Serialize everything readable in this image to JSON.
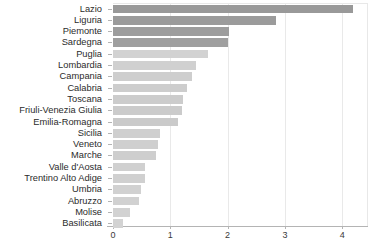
{
  "chart_data": {
    "type": "bar",
    "orientation": "horizontal",
    "title": "",
    "subtitle": "",
    "xlabel": "",
    "ylabel": "",
    "categories": [
      "Lazio",
      "Liguria",
      "Piemonte",
      "Sardegna",
      "Puglia",
      "Lombardia",
      "Campania",
      "Calabria",
      "Toscana",
      "Friuli-Venezia Giulia",
      "Emilia-Romagna",
      "Sicilia",
      "Veneto",
      "Marche",
      "Valle d'Aosta",
      "Trentino Alto Adige",
      "Umbria",
      "Abruzzo",
      "Molise",
      "Basilicata"
    ],
    "values": [
      4.18,
      2.85,
      2.03,
      2.0,
      1.65,
      1.45,
      1.38,
      1.3,
      1.22,
      1.2,
      1.13,
      0.82,
      0.78,
      0.75,
      0.56,
      0.55,
      0.48,
      0.45,
      0.3,
      0.18
    ],
    "bar_colors": [
      "#999999",
      "#9b9b9b",
      "#9d9d9d",
      "#9f9f9f",
      "#d2d2d2",
      "#d0d0d0",
      "#cecece",
      "#cdcdcd",
      "#cccccc",
      "#cbcbcb",
      "#cacaca",
      "#cfcfcf",
      "#cfcfcf",
      "#cecece",
      "#d0d0d0",
      "#d0d0d0",
      "#d1d1d1",
      "#d1d1d1",
      "#d2d2d2",
      "#d3d3d3"
    ],
    "xticks": [
      0,
      1,
      2,
      3,
      4
    ],
    "xticklabels": [
      "0",
      "1",
      "2",
      "3",
      "4"
    ],
    "xlim": [
      0,
      4.45
    ],
    "grid": "vertical",
    "legend": "none"
  }
}
